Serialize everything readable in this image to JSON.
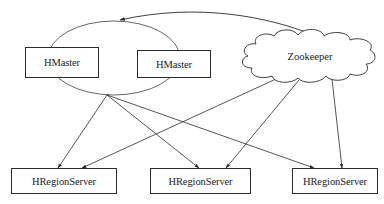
{
  "diagram": {
    "type": "architecture",
    "nodes": {
      "hmaster_1": {
        "label": "HMaster",
        "shape": "rectangle"
      },
      "hmaster_2": {
        "label": "HMaster",
        "shape": "rectangle"
      },
      "zookeeper": {
        "label": "Zookeeper",
        "shape": "cloud"
      },
      "regionserver_1": {
        "label": "HRegionServer",
        "shape": "rectangle"
      },
      "regionserver_2": {
        "label": "HRegionServer",
        "shape": "rectangle"
      },
      "regionserver_3": {
        "label": "HRegionServer",
        "shape": "rectangle"
      }
    },
    "groups": [
      {
        "id": "hmaster_group",
        "shape": "ellipse",
        "members": [
          "hmaster_1",
          "hmaster_2"
        ]
      }
    ],
    "edges": [
      {
        "from": "zookeeper",
        "to": "hmaster_group",
        "arrow": "end"
      },
      {
        "from": "hmaster_group",
        "to": "regionserver_1",
        "arrow": "end"
      },
      {
        "from": "hmaster_group",
        "to": "regionserver_2",
        "arrow": "end"
      },
      {
        "from": "hmaster_group",
        "to": "regionserver_3",
        "arrow": "end"
      },
      {
        "from": "zookeeper",
        "to": "regionserver_1",
        "arrow": "end"
      },
      {
        "from": "zookeeper",
        "to": "regionserver_2",
        "arrow": "end"
      },
      {
        "from": "zookeeper",
        "to": "regionserver_3",
        "arrow": "end"
      }
    ],
    "colors": {
      "stroke": "#2a2a2a",
      "text": "#222222",
      "background": "#ffffff"
    }
  }
}
